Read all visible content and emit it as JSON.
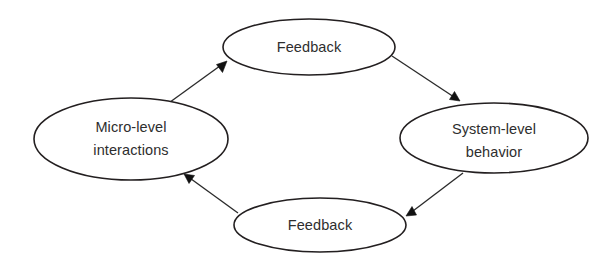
{
  "diagram": {
    "type": "cycle-feedback-loop",
    "background_color": "#ffffff",
    "stroke_color": "#231f20",
    "text_color": "#2e2e2e",
    "arrow_color": "#111111",
    "nodes": [
      {
        "id": "feedback-top",
        "label": "Feedback",
        "lines": [
          "Feedback"
        ],
        "cx": 309,
        "cy": 47,
        "rx": 86,
        "ry": 28
      },
      {
        "id": "micro-level-interactions",
        "label": "Micro-level interactions",
        "lines": [
          "Micro-level",
          "interactions"
        ],
        "cx": 131,
        "cy": 139,
        "rx": 97,
        "ry": 41
      },
      {
        "id": "system-level-behavior",
        "label": "System-level behavior",
        "lines": [
          "System-level",
          "behavior"
        ],
        "cx": 494,
        "cy": 138,
        "rx": 94,
        "ry": 35
      },
      {
        "id": "feedback-bottom",
        "label": "Feedback",
        "lines": [
          "Feedback"
        ],
        "cx": 320,
        "cy": 225,
        "rx": 86,
        "ry": 27
      }
    ],
    "edges": [
      {
        "id": "edge-micro-to-feedback-top",
        "from": "micro-level-interactions",
        "to": "feedback-top",
        "direction": "up-right",
        "x1": 166,
        "y1": 105,
        "x2": 227,
        "y2": 61
      },
      {
        "id": "edge-feedback-top-to-system",
        "from": "feedback-top",
        "to": "system-level-behavior",
        "direction": "down-right",
        "x1": 392,
        "y1": 56,
        "x2": 460,
        "y2": 101
      },
      {
        "id": "edge-system-to-feedback-bottom",
        "from": "system-level-behavior",
        "to": "feedback-bottom",
        "direction": "down-left",
        "x1": 463,
        "y1": 173,
        "x2": 406,
        "y2": 216
      },
      {
        "id": "edge-feedback-bottom-to-micro",
        "from": "feedback-bottom",
        "to": "micro-level-interactions",
        "direction": "up-left",
        "x1": 238,
        "y1": 213,
        "x2": 184,
        "y2": 174
      }
    ]
  }
}
